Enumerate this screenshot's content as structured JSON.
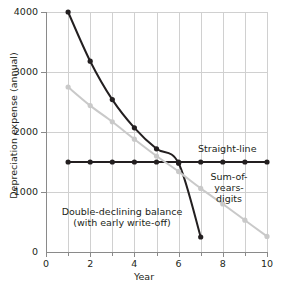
{
  "chart_data": {
    "type": "line",
    "title": "",
    "xlabel": "Year",
    "ylabel": "Depreciation expense (annual)",
    "xlim": [
      0,
      10
    ],
    "ylim": [
      0,
      4000
    ],
    "xticks": [
      0,
      2,
      4,
      6,
      8,
      10
    ],
    "xticklabels": [
      "0",
      "2",
      "4",
      "6",
      "8",
      "10"
    ],
    "xminorticks": [
      1,
      3,
      5,
      7,
      9
    ],
    "yticks": [
      0,
      1000,
      2000,
      3000,
      4000
    ],
    "yticklabels": [
      "0",
      "1000",
      "2000",
      "3000",
      "4000"
    ],
    "grid": true,
    "legend_position": "inline-annotations",
    "series": [
      {
        "name": "Double-declining balance (with early write-off)",
        "color": "#231f20",
        "x": [
          1,
          2,
          3,
          4,
          5,
          6,
          7
        ],
        "values": [
          4000,
          3180,
          2540,
          2070,
          1720,
          1480,
          250
        ]
      },
      {
        "name": "Straight-line",
        "color": "#231f20",
        "x": [
          1,
          2,
          3,
          4,
          5,
          6,
          7,
          8,
          9,
          10
        ],
        "values": [
          1500,
          1500,
          1500,
          1500,
          1500,
          1500,
          1500,
          1500,
          1500,
          1500
        ]
      },
      {
        "name": "Sum-of-years-digits",
        "color": "#c9c9c9",
        "x": [
          1,
          2,
          3,
          4,
          5,
          6,
          7,
          8,
          9,
          10
        ],
        "values": [
          2750,
          2440,
          2170,
          1880,
          1600,
          1340,
          1060,
          800,
          530,
          260
        ]
      }
    ],
    "annotations": [
      {
        "text": "Straight-line",
        "x": 7.3,
        "y": 1720
      },
      {
        "text": "Sum-of-years-\ndigits",
        "line1": "Sum-of-years-",
        "line2": "digits",
        "x": 7.4,
        "y": 1200
      },
      {
        "text": "Double-declining balance\n(with early write-off)",
        "line1": "Double-declining balance",
        "line2": "(with early write-off)",
        "x": 3.4,
        "y": 640
      }
    ]
  },
  "axis": {
    "ylabel": "Depreciation expense (annual)",
    "xlabel": "Year"
  },
  "labels": {
    "straight_line": "Straight-line",
    "syd_line1": "Sum-of-years-",
    "syd_line2": "digits",
    "ddb_line1": "Double-declining balance",
    "ddb_line2": "(with early write-off)"
  },
  "colors": {
    "dark": "#231f20",
    "light": "#c9c9c9",
    "grid": "#d0d0d0",
    "axis": "#8a8a8a",
    "background": "#ffffff"
  }
}
